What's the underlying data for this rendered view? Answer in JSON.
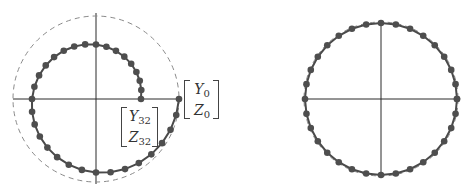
{
  "figure": {
    "left_panel": {
      "description": "Spiral trajectory of 33 sampled points converging inward",
      "center": [
        96,
        99
      ],
      "dashed_circle_radius": 83,
      "spiral": {
        "r_start": 83,
        "r_end": 45,
        "points": 33,
        "turns": 1
      },
      "labels": {
        "start": {
          "top": "Y",
          "top_sub": "0",
          "bottom": "Z",
          "bottom_sub": "0"
        },
        "end": {
          "top": "Y",
          "top_sub": "32",
          "bottom": "Z",
          "bottom_sub": "32"
        }
      }
    },
    "right_panel": {
      "description": "Points lying on a circle closely following the dashed reference circle",
      "center": [
        381,
        99
      ],
      "dashed_circle_radius": 77,
      "circle": {
        "radius": 76,
        "points": 33
      }
    },
    "colors": {
      "axis": "#2a2a2a",
      "dashed": "#8a8a8a",
      "curve": "#4a4a4a",
      "dot": "#4e4e4e"
    }
  }
}
